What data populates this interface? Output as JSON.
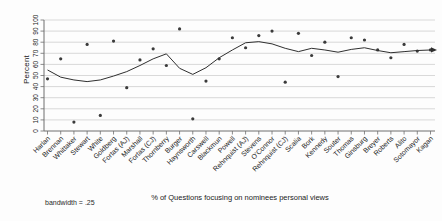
{
  "window": {
    "background": "#fdfdfd"
  },
  "chart_data": {
    "type": "scatter",
    "title": "",
    "ylabel": "Percent",
    "caption": "% of Questions focusing on nominees personal views",
    "note": "bandwidth = .25",
    "ylim": [
      0,
      100
    ],
    "yticks": [
      0,
      10,
      20,
      30,
      40,
      50,
      60,
      70,
      80,
      90,
      100
    ],
    "grid": true,
    "legend": "none",
    "categories": [
      "Harlan",
      "Brennan",
      "Whittaker",
      "Stewart",
      "White",
      "Goldberg",
      "Fortas (AJ)",
      "Marshall",
      "Fortas (CJ)",
      "Thornberry",
      "Burger",
      "Haynsworth",
      "Carswell",
      "Blackmun",
      "Powell",
      "Rehnquist (AJ)",
      "Stevens",
      "O'Connor",
      "Rehnquist (CJ)",
      "Scalia",
      "Bork",
      "Kennedy",
      "Souter",
      "Thomas",
      "Ginsburg",
      "Breyer",
      "Roberts",
      "Alito",
      "Sotomayor",
      "Kagan"
    ],
    "series": [
      {
        "name": "percent-of-questions-scatter",
        "type": "scatter",
        "values": [
          47,
          65,
          8,
          78,
          14,
          81,
          39,
          64,
          74,
          59,
          92,
          11,
          45,
          65,
          84,
          75,
          86,
          90,
          44,
          88,
          68,
          80,
          49,
          84,
          82,
          73,
          66,
          78,
          72,
          73
        ]
      },
      {
        "name": "lowess-smooth",
        "type": "line",
        "arrow_end": true,
        "values": [
          55,
          48.5,
          46,
          44.5,
          46,
          49.5,
          53.5,
          59,
          65,
          69.5,
          56.5,
          51,
          57,
          66,
          73,
          79.5,
          80.5,
          78.5,
          74.5,
          71.5,
          74.5,
          73,
          71,
          73.5,
          75,
          72.5,
          70.5,
          71.5,
          72.5,
          73
        ]
      }
    ],
    "colors": {
      "point": "#3b3b3b",
      "line": "#2f2f2f",
      "grid": "#c9c9c9",
      "axis": "#6e6e6e",
      "tick_text": "#1a1a1a",
      "background": "#fdfdfd"
    }
  }
}
